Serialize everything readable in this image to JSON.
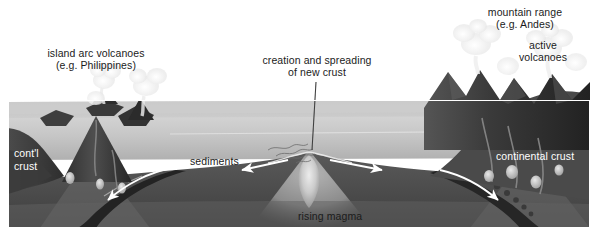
{
  "figure": {
    "frame_color": "#ffffff",
    "palette": {
      "sky": "#f4f4f4",
      "ocean_top": "#cfcfcf",
      "ocean_bottom": "#b4b4b4",
      "ocean_floor": "#8d8d8d",
      "crust_dark": "#4a4a4a",
      "mantle": "#6e6e6e",
      "mantle_deep": "#5a5a5a",
      "slab": "#2b2b2b",
      "magma_light": "#d8d8d8",
      "volcano_dark": "#3a3a3a",
      "plume_white": "#f2f2f2",
      "arrow_white": "#ffffff",
      "leader_line": "#404040",
      "text_dark": "#1b1b1b",
      "text_light": "#ffffff"
    }
  },
  "labels": {
    "island_arc_line1": "island arc volcanoes",
    "island_arc_line2": "(e.g. Philippines)",
    "creation_line1": "creation and spreading",
    "creation_line2": "of new crust",
    "mountain_line1": "mountain range",
    "mountain_line2": "(e.g. Andes)",
    "active_line1": "active",
    "active_line2": "volcanoes",
    "contl_line1": "cont'l",
    "contl_line2": "crust",
    "continental_crust": "continental crust",
    "sediments": "sediments",
    "rising_magma": "rising magma"
  },
  "features": [
    {
      "name": "island-arc-volcanoes",
      "side": "left",
      "kind": "volcanic-island-arc",
      "count": 3
    },
    {
      "name": "mid-ocean-ridge",
      "side": "center",
      "kind": "spreading-center"
    },
    {
      "name": "left-subduction-zone",
      "side": "left",
      "kind": "subduction",
      "arrow": "down-left"
    },
    {
      "name": "right-subduction-zone",
      "side": "right",
      "kind": "subduction",
      "arrow": "down-right"
    },
    {
      "name": "spreading-arrow-left",
      "side": "center",
      "kind": "spreading-arrow",
      "arrow": "left"
    },
    {
      "name": "spreading-arrow-right",
      "side": "center",
      "kind": "spreading-arrow",
      "arrow": "right"
    },
    {
      "name": "andes-mountain-range",
      "side": "right",
      "kind": "continental-mountains"
    }
  ]
}
